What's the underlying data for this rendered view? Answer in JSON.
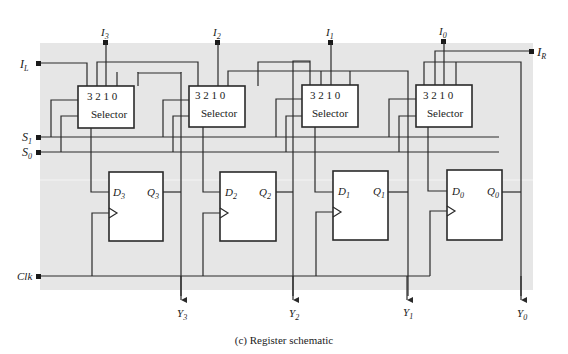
{
  "caption": "(c)  Register schematic",
  "colors": {
    "background": "#e6e6e6",
    "wire": "#2a2a2a",
    "box_fill": "#ffffff"
  },
  "inputs": {
    "IL": {
      "main": "I",
      "sub": "L"
    },
    "IR": {
      "main": "I",
      "sub": "R"
    },
    "S1": {
      "main": "S",
      "sub": "1"
    },
    "S0": {
      "main": "S",
      "sub": "0"
    },
    "Clk": "Clk",
    "I3": {
      "main": "I",
      "sub": "3"
    },
    "I2": {
      "main": "I",
      "sub": "2"
    },
    "I1": {
      "main": "I",
      "sub": "1"
    },
    "I0": {
      "main": "I",
      "sub": "0"
    }
  },
  "selectors": [
    {
      "label": "Selector",
      "pins": "3 2 1 0"
    },
    {
      "label": "Selector",
      "pins": "3 2 1 0"
    },
    {
      "label": "Selector",
      "pins": "3 2 1 0"
    },
    {
      "label": "Selector",
      "pins": "3 2 1 0"
    }
  ],
  "flipflops": [
    {
      "d": "D",
      "q": "Q",
      "sub": "3"
    },
    {
      "d": "D",
      "q": "Q",
      "sub": "2"
    },
    {
      "d": "D",
      "q": "Q",
      "sub": "1"
    },
    {
      "d": "D",
      "q": "Q",
      "sub": "0"
    }
  ],
  "outputs": [
    {
      "main": "Y",
      "sub": "3"
    },
    {
      "main": "Y",
      "sub": "2"
    },
    {
      "main": "Y",
      "sub": "1"
    },
    {
      "main": "Y",
      "sub": "0"
    }
  ]
}
